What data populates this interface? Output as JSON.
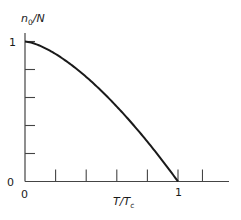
{
  "chart_data": {
    "type": "line",
    "title": "",
    "xlabel": "T/T_c",
    "ylabel": "n_0/N",
    "xlim": [
      0,
      1.35
    ],
    "ylim": [
      0,
      1.0
    ],
    "grid": false,
    "legend": null,
    "x_tick_labels": [
      {
        "value": 0,
        "label": "0"
      },
      {
        "value": 1,
        "label": "1"
      }
    ],
    "y_tick_labels": [
      {
        "value": 0,
        "label": "0"
      },
      {
        "value": 1,
        "label": "1"
      }
    ],
    "x_ticks": [
      0.2,
      0.4,
      0.6,
      0.8,
      1.0,
      1.16
    ],
    "y_ticks": [
      0.2,
      0.4,
      0.6,
      0.8,
      1.0
    ],
    "series": [
      {
        "name": "condensate fraction",
        "formula": "1 - (T/Tc)^(3/2)",
        "x": [
          0,
          0.1,
          0.2,
          0.3,
          0.4,
          0.5,
          0.6,
          0.7,
          0.8,
          0.9,
          1.0
        ],
        "values": [
          1.0,
          0.968,
          0.911,
          0.836,
          0.747,
          0.646,
          0.535,
          0.414,
          0.284,
          0.146,
          0.0
        ]
      }
    ]
  },
  "labels": {
    "ylabel_main": "n",
    "ylabel_sub": "0",
    "ylabel_rest": "/N",
    "xlabel_main": "T/T",
    "xlabel_sub": "c",
    "y_one": "1",
    "y_zero": "0",
    "x_zero": "0",
    "x_one": "1"
  },
  "colors": {
    "line": "#1a1a1a",
    "axis": "#444444",
    "background": "#ffffff"
  }
}
